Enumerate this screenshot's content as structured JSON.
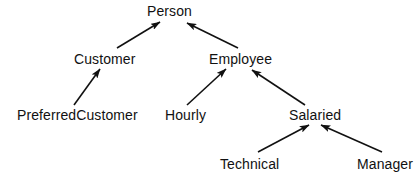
{
  "diagram": {
    "kind": "class-inheritance-hierarchy",
    "background_color": "#ffffff",
    "line_color": "#111111",
    "text_color": "#111111",
    "arrow_style": "solid-filled-triangle",
    "arrow_direction": "subclass-points-to-superclass",
    "width": 420,
    "height": 182,
    "nodes": [
      {
        "id": "person",
        "label": "Person",
        "x": 147,
        "y": 4,
        "level": 0
      },
      {
        "id": "customer",
        "label": "Customer",
        "x": 74,
        "y": 52,
        "level": 1
      },
      {
        "id": "employee",
        "label": "Employee",
        "x": 209,
        "y": 52,
        "level": 1
      },
      {
        "id": "preferredcustomer",
        "label": "PreferredCustomer",
        "x": 17,
        "y": 108,
        "level": 2
      },
      {
        "id": "hourly",
        "label": "Hourly",
        "x": 165,
        "y": 108,
        "level": 2
      },
      {
        "id": "salaried",
        "label": "Salaried",
        "x": 289,
        "y": 108,
        "level": 2
      },
      {
        "id": "technical",
        "label": "Technical",
        "x": 220,
        "y": 157,
        "level": 3
      },
      {
        "id": "manager",
        "label": "Manager",
        "x": 357,
        "y": 157,
        "level": 3
      }
    ],
    "edges": [
      {
        "id": "customer-to-person",
        "from": "customer",
        "to": "person",
        "x1": 117,
        "y1": 48,
        "x2": 160,
        "y2": 22
      },
      {
        "id": "employee-to-person",
        "from": "employee",
        "to": "person",
        "x1": 238,
        "y1": 48,
        "x2": 187,
        "y2": 23
      },
      {
        "id": "preferredcustomer-to-customer",
        "from": "preferredcustomer",
        "to": "customer",
        "x1": 74,
        "y1": 105,
        "x2": 100,
        "y2": 69
      },
      {
        "id": "hourly-to-employee",
        "from": "hourly",
        "to": "employee",
        "x1": 187,
        "y1": 105,
        "x2": 226,
        "y2": 69
      },
      {
        "id": "salaried-to-employee",
        "from": "salaried",
        "to": "employee",
        "x1": 305,
        "y1": 105,
        "x2": 252,
        "y2": 70
      },
      {
        "id": "technical-to-salaried",
        "from": "technical",
        "to": "salaried",
        "x1": 258,
        "y1": 152,
        "x2": 309,
        "y2": 125
      },
      {
        "id": "manager-to-salaried",
        "from": "manager",
        "to": "salaried",
        "x1": 382,
        "y1": 152,
        "x2": 321,
        "y2": 125
      }
    ]
  }
}
